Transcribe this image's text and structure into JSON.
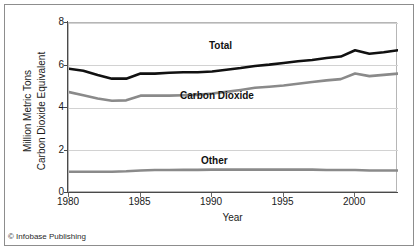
{
  "figure": {
    "credit": "© Infobase Publishing"
  },
  "chart_data": {
    "type": "line",
    "title": "",
    "xlabel": "Year",
    "ylabel": "Million Metric Tons Carbon Dioxide Equivalent",
    "ylabel_line1": "Million Metric Tons",
    "ylabel_line2": "Carbon Dioxide Equivalent",
    "xlim": [
      1980,
      2003
    ],
    "ylim": [
      0,
      8
    ],
    "grid": true,
    "grid_axis": "y",
    "legend_position": "inline-labels",
    "x_ticks": [
      1980,
      1985,
      1990,
      1995,
      2000
    ],
    "x_tick_labels": [
      "1980",
      "1985",
      "1990",
      "1995",
      "2000"
    ],
    "y_ticks": [
      0,
      2,
      4,
      6,
      8
    ],
    "y_tick_labels": [
      "0",
      "2",
      "4",
      "6",
      "8"
    ],
    "x": [
      1980,
      1981,
      1982,
      1983,
      1984,
      1985,
      1986,
      1987,
      1988,
      1989,
      1990,
      1991,
      1992,
      1993,
      1994,
      1995,
      1996,
      1997,
      1998,
      1999,
      2000,
      2001,
      2002,
      2003
    ],
    "series": [
      {
        "name": "Total",
        "color": "#111111",
        "width": 2.6,
        "values": [
          5.85,
          5.75,
          5.55,
          5.38,
          5.38,
          5.62,
          5.62,
          5.66,
          5.68,
          5.68,
          5.72,
          5.8,
          5.88,
          5.98,
          6.04,
          6.12,
          6.2,
          6.26,
          6.35,
          6.42,
          6.72,
          6.55,
          6.62,
          6.72
        ],
        "label_position": {
          "x": 209,
          "y": 40
        }
      },
      {
        "name": "Carbon Dioxide",
        "color": "#8a8a8a",
        "width": 2.6,
        "values": [
          4.75,
          4.6,
          4.45,
          4.34,
          4.36,
          4.58,
          4.58,
          4.58,
          4.6,
          4.62,
          4.68,
          4.76,
          4.85,
          4.95,
          5.0,
          5.06,
          5.14,
          5.22,
          5.3,
          5.36,
          5.62,
          5.5,
          5.56,
          5.62
        ],
        "label_position": {
          "x": 180,
          "y": 90
        }
      },
      {
        "name": "Other",
        "color": "#8a8a8a",
        "width": 2.6,
        "values": [
          1.0,
          1.0,
          1.0,
          1.0,
          1.02,
          1.06,
          1.08,
          1.08,
          1.09,
          1.09,
          1.1,
          1.1,
          1.1,
          1.1,
          1.1,
          1.1,
          1.1,
          1.1,
          1.08,
          1.08,
          1.08,
          1.06,
          1.06,
          1.06
        ],
        "label_position": {
          "x": 201,
          "y": 155
        }
      }
    ]
  }
}
